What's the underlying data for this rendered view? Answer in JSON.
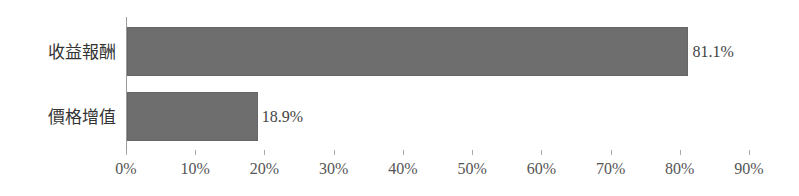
{
  "chart_data": {
    "type": "bar",
    "orientation": "horizontal",
    "title": "",
    "xlabel": "",
    "ylabel": "",
    "categories": [
      "收益報酬",
      "價格增值"
    ],
    "values": [
      81.1,
      18.9
    ],
    "value_labels": [
      "81.1%",
      "18.9%"
    ],
    "xlim": [
      0,
      90
    ],
    "x_ticks": [
      "0%",
      "10%",
      "20%",
      "30%",
      "40%",
      "50%",
      "60%",
      "70%",
      "80%",
      "90%"
    ],
    "grid": false,
    "legend": null,
    "bar_color": "#6e6e6e"
  }
}
